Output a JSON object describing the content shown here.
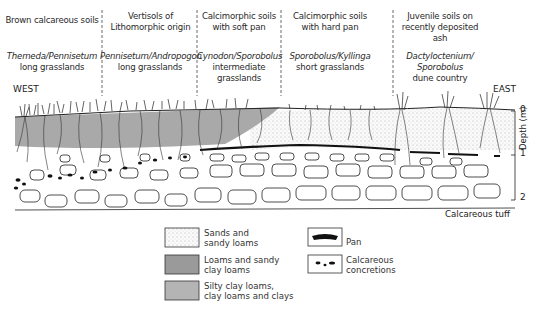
{
  "zones": [
    {
      "soil": "Brown calcareous soils",
      "vegetation_species": "Themeda/Pennisetum",
      "vegetation_type": "long grasslands"
    },
    {
      "soil": "Vertisols of Lithomorphic origin",
      "vegetation_species": "Pennisetum/Andropogon",
      "vegetation_type": "long grasslands"
    },
    {
      "soil": "Calcimorphic soils with soft pan",
      "vegetation_species": "Cynodon/Sporobolus",
      "vegetation_type": "intermediate grasslands"
    },
    {
      "soil": "Calcimorphic soils with hard pan",
      "vegetation_species": "Sporobolus/Kyllinga",
      "vegetation_type": "short grasslands"
    },
    {
      "soil": "Juvenile soils on recently deposited ash",
      "vegetation_species": "Dactyloctenium/ Sporobolus",
      "vegetation_type": "dune country"
    }
  ],
  "labels": {
    "west": "WEST",
    "east": "EAST",
    "substrate": "Calcareous tuff",
    "depth_axis": "Depth (m)",
    "depth_ticks": [
      "0",
      "1",
      "2"
    ]
  },
  "legend": [
    {
      "label_1": "Sands and",
      "label_2": "sandy loams",
      "pattern": "stipple",
      "color": "#f1f1f1"
    },
    {
      "label_1": "Loams and sandy",
      "label_2": "clay loams",
      "pattern": "solid",
      "color": "#9a9a9a"
    },
    {
      "label_1": "Silty clay loams,",
      "label_2": "clay loams and clays",
      "pattern": "solid",
      "color": "#b4b4b4"
    },
    {
      "label_1": "Pan",
      "label_2": "",
      "pattern": "pan-icon",
      "color": "#111111"
    },
    {
      "label_1": "Calcareous",
      "label_2": "concretions",
      "pattern": "concretions-icon",
      "color": "#111111"
    }
  ],
  "colors": {
    "loam_band": "#a9a9a9",
    "line": "#222222"
  }
}
